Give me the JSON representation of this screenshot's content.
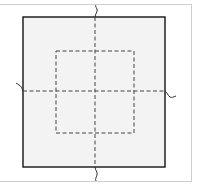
{
  "diagram": {
    "type": "square-with-centerlines",
    "colors": {
      "background": "#ffffff",
      "frame": "#cfcfcf",
      "outer_fill": "#f3f3f3",
      "outer_stroke": "#222222",
      "dash_stroke": "#444444"
    },
    "outer_square": {
      "x": 23,
      "y": 17,
      "width": 142,
      "height": 150
    },
    "inner_dashed_square": {
      "x": 56,
      "y": 51,
      "width": 78,
      "height": 82
    },
    "centerlines": {
      "vertical_x": 95,
      "horizontal_y": 91
    },
    "break_symbols": [
      "top",
      "bottom",
      "left",
      "right"
    ]
  }
}
